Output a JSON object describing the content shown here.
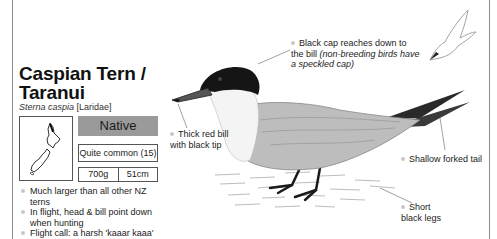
{
  "species": {
    "common_name_line1": "Caspian Tern /",
    "common_name_line2": "Taranui",
    "scientific_name": "Sterna caspia",
    "family": "[Laridae]"
  },
  "status": {
    "label": "Native",
    "color": "#9a9a9a"
  },
  "abundance": "Quite common (15)",
  "size": {
    "weight": "700g",
    "length": "51cm"
  },
  "facts": [
    "Much larger than all other NZ terns",
    "In flight, head & bill point down when hunting",
    "Flight call: a harsh 'kaaar kaaa'"
  ],
  "annotations": {
    "cap": {
      "text": "Black cap reaches down to the bill",
      "note": "(non-breeding birds have a speckled cap)"
    },
    "bill": "Thick red bill with black tip",
    "tail": "Shallow forked tail",
    "legs": "Short black legs"
  },
  "icons": {
    "map": "nz-map-icon",
    "bird": "caspian-tern-illustration",
    "flight": "tern-flight-silhouette"
  }
}
